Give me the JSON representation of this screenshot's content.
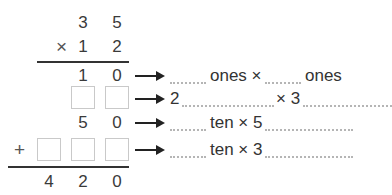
{
  "problem": {
    "multiplicand": [
      "3",
      "5"
    ],
    "multiplier_sign": "×",
    "multiplier": [
      "1",
      "2"
    ],
    "partial_products": [
      {
        "digits": [
          "1",
          "0"
        ],
        "boxes": 0
      },
      {
        "digits": [],
        "boxes": 2
      },
      {
        "digits": [
          "5",
          "0"
        ],
        "boxes": 0
      },
      {
        "digits": [],
        "boxes": 3,
        "sign": "+"
      }
    ],
    "sum": [
      "4",
      "2",
      "0"
    ]
  },
  "explanations": [
    {
      "parts": [
        "ones ×",
        "ones"
      ]
    },
    {
      "prefix": "2",
      "parts": [
        "× 3"
      ]
    },
    {
      "parts": [
        "ten × 5"
      ]
    },
    {
      "parts": [
        "ten × 3"
      ]
    }
  ],
  "colors": {
    "text": "#333333",
    "box_border": "#c9c9c9",
    "dots": "#b5b5b5",
    "arrow": "#222222"
  }
}
